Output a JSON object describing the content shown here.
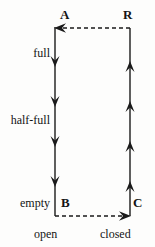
{
  "figure": {
    "type": "state-transition-diagram",
    "background_color": "#fdfdfc",
    "stroke_color": "#1a1a1a"
  },
  "nodes": [
    {
      "id": "A",
      "label": "A",
      "x": 55,
      "y": 27,
      "corner": "top-left"
    },
    {
      "id": "R",
      "label": "R",
      "x": 130,
      "y": 28,
      "corner": "top-right"
    },
    {
      "id": "B",
      "label": "B",
      "x": 55,
      "y": 215,
      "corner": "bottom-left"
    },
    {
      "id": "C",
      "label": "C",
      "x": 130,
      "y": 215,
      "corner": "bottom-right"
    }
  ],
  "edges": [
    {
      "id": "edge-left",
      "from": "A",
      "to": "B",
      "style": "solid",
      "direction": "down",
      "arrowhead_count": 4,
      "arrowhead_positions_y": [
        64,
        104,
        144,
        184
      ]
    },
    {
      "id": "edge-bottom",
      "from": "B",
      "to": "C",
      "style": "dashed",
      "direction": "right",
      "arrowhead_count": 1,
      "arrowhead_positions_x": [
        126
      ]
    },
    {
      "id": "edge-right",
      "from": "C",
      "to": "R",
      "style": "solid",
      "direction": "up",
      "arrowhead_count": 4,
      "arrowhead_positions_y": [
        181,
        141,
        101,
        61
      ]
    },
    {
      "id": "edge-top",
      "from": "R",
      "to": "A",
      "style": "dashed",
      "direction": "left",
      "arrowhead_count": 1,
      "arrowhead_positions_x": [
        60
      ]
    }
  ],
  "level_labels": [
    {
      "id": "full",
      "text": "full",
      "y": 47
    },
    {
      "id": "half-full",
      "text": "half-full",
      "y": 114
    },
    {
      "id": "empty",
      "text": "empty",
      "y": 197
    }
  ],
  "axis_labels": [
    {
      "id": "open",
      "text": "open",
      "under": "B"
    },
    {
      "id": "closed",
      "text": "closed",
      "under": "C"
    }
  ]
}
